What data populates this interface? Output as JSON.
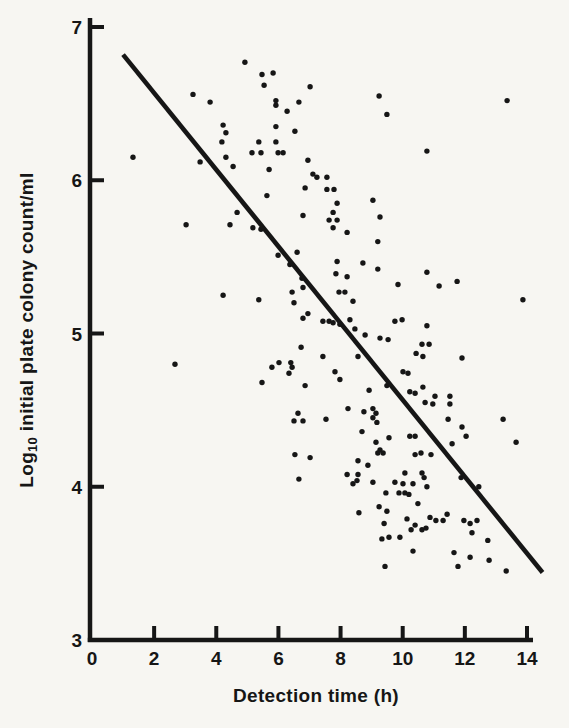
{
  "figure": {
    "background": "#f7f6f2",
    "ink": "#161616"
  },
  "chart_data": {
    "type": "scatter",
    "title": "",
    "xlabel": "Detection time (h)",
    "ylabel": "Log10 initial plate colony count/ml",
    "ylabel_parts": [
      {
        "text": "Log",
        "sub": false
      },
      {
        "text": "10",
        "sub": true
      },
      {
        "text": " initial plate colony count/ml",
        "sub": false
      }
    ],
    "xlim": [
      0,
      14
    ],
    "ylim": [
      3,
      7
    ],
    "xticks": [
      0,
      2,
      4,
      6,
      8,
      10,
      12,
      14
    ],
    "yticks": [
      3,
      4,
      5,
      6,
      7
    ],
    "grid": false,
    "legend": null,
    "marker": {
      "shape": "dot",
      "radius_px": 2.7,
      "color": "#161616"
    },
    "trendline": {
      "x1": 1.0,
      "y1": 6.82,
      "x2": 14.5,
      "y2": 3.44,
      "color": "#161616"
    },
    "points": [
      [
        3.25,
        6.56
      ],
      [
        3.8,
        6.51
      ],
      [
        4.92,
        6.77
      ],
      [
        4.22,
        6.36
      ],
      [
        4.31,
        6.31
      ],
      [
        4.18,
        6.25
      ],
      [
        4.31,
        6.15
      ],
      [
        3.48,
        6.12
      ],
      [
        4.54,
        6.09
      ],
      [
        1.32,
        6.15
      ],
      [
        4.67,
        5.79
      ],
      [
        3.03,
        5.71
      ],
      [
        4.44,
        5.71
      ],
      [
        5.47,
        6.69
      ],
      [
        5.83,
        6.7
      ],
      [
        5.54,
        6.62
      ],
      [
        7.02,
        6.61
      ],
      [
        5.92,
        6.52
      ],
      [
        5.92,
        6.49
      ],
      [
        6.66,
        6.51
      ],
      [
        6.28,
        6.45
      ],
      [
        9.24,
        6.55
      ],
      [
        9.49,
        6.43
      ],
      [
        5.92,
        6.35
      ],
      [
        6.53,
        6.32
      ],
      [
        5.37,
        6.25
      ],
      [
        5.92,
        6.25
      ],
      [
        5.15,
        6.18
      ],
      [
        5.44,
        6.18
      ],
      [
        5.99,
        6.18
      ],
      [
        6.15,
        6.18
      ],
      [
        5.7,
        6.07
      ],
      [
        6.95,
        6.13
      ],
      [
        7.11,
        6.04
      ],
      [
        7.24,
        6.02
      ],
      [
        7.56,
        6.02
      ],
      [
        6.86,
        5.95
      ],
      [
        7.56,
        5.94
      ],
      [
        7.79,
        5.94
      ],
      [
        7.89,
        5.85
      ],
      [
        5.63,
        5.9
      ],
      [
        7.76,
        5.79
      ],
      [
        6.79,
        5.77
      ],
      [
        7.63,
        5.74
      ],
      [
        7.89,
        5.74
      ],
      [
        7.76,
        5.69
      ],
      [
        9.04,
        5.87
      ],
      [
        9.27,
        5.76
      ],
      [
        5.18,
        5.69
      ],
      [
        5.44,
        5.68
      ],
      [
        8.21,
        5.66
      ],
      [
        9.2,
        5.6
      ],
      [
        13.36,
        6.52
      ],
      [
        10.78,
        6.19
      ],
      [
        4.22,
        5.25
      ],
      [
        2.67,
        4.8
      ],
      [
        5.99,
        5.51
      ],
      [
        6.6,
        5.53
      ],
      [
        6.37,
        5.45
      ],
      [
        7.89,
        5.47
      ],
      [
        8.72,
        5.46
      ],
      [
        9.2,
        5.42
      ],
      [
        7.85,
        5.39
      ],
      [
        8.21,
        5.37
      ],
      [
        6.76,
        5.36
      ],
      [
        6.79,
        5.3
      ],
      [
        6.44,
        5.27
      ],
      [
        5.37,
        5.22
      ],
      [
        6.5,
        5.2
      ],
      [
        7.95,
        5.27
      ],
      [
        8.14,
        5.27
      ],
      [
        8.4,
        5.21
      ],
      [
        6.95,
        5.13
      ],
      [
        6.79,
        5.1
      ],
      [
        7.43,
        5.08
      ],
      [
        7.63,
        5.08
      ],
      [
        7.76,
        5.07
      ],
      [
        7.98,
        5.06
      ],
      [
        8.3,
        5.09
      ],
      [
        8.46,
        5.03
      ],
      [
        8.79,
        4.99
      ],
      [
        9.27,
        4.97
      ],
      [
        9.53,
        4.96
      ],
      [
        6.73,
        4.91
      ],
      [
        7.43,
        4.85
      ],
      [
        8.56,
        4.85
      ],
      [
        6.02,
        4.81
      ],
      [
        6.4,
        4.81
      ],
      [
        5.79,
        4.78
      ],
      [
        6.44,
        4.78
      ],
      [
        6.34,
        4.74
      ],
      [
        7.82,
        4.75
      ],
      [
        7.98,
        4.7
      ],
      [
        5.47,
        4.68
      ],
      [
        6.86,
        4.66
      ],
      [
        8.92,
        4.63
      ],
      [
        9.49,
        4.66
      ],
      [
        8.24,
        4.51
      ],
      [
        6.63,
        4.48
      ],
      [
        6.5,
        4.43
      ],
      [
        6.79,
        4.43
      ],
      [
        7.53,
        4.44
      ],
      [
        8.75,
        4.49
      ],
      [
        9.04,
        4.51
      ],
      [
        9.14,
        4.48
      ],
      [
        9.04,
        4.45
      ],
      [
        9.17,
        4.42
      ],
      [
        8.69,
        4.36
      ],
      [
        9.56,
        4.32
      ],
      [
        9.27,
        4.24
      ],
      [
        10.78,
        5.4
      ],
      [
        11.17,
        5.31
      ],
      [
        11.75,
        5.34
      ],
      [
        9.85,
        5.32
      ],
      [
        13.87,
        5.22
      ],
      [
        9.75,
        5.08
      ],
      [
        9.98,
        5.09
      ],
      [
        10.78,
        5.05
      ],
      [
        10.62,
        4.93
      ],
      [
        10.85,
        4.93
      ],
      [
        10.43,
        4.87
      ],
      [
        10.65,
        4.85
      ],
      [
        11.91,
        4.84
      ],
      [
        10.01,
        4.75
      ],
      [
        10.17,
        4.74
      ],
      [
        10.65,
        4.65
      ],
      [
        10.23,
        4.62
      ],
      [
        10.4,
        4.61
      ],
      [
        11.04,
        4.59
      ],
      [
        10.72,
        4.55
      ],
      [
        10.97,
        4.54
      ],
      [
        11.52,
        4.59
      ],
      [
        11.52,
        4.54
      ],
      [
        11.46,
        4.44
      ],
      [
        11.91,
        4.39
      ],
      [
        12.04,
        4.33
      ],
      [
        13.23,
        4.44
      ],
      [
        10.23,
        4.33
      ],
      [
        10.4,
        4.33
      ],
      [
        11.59,
        4.28
      ],
      [
        13.65,
        4.29
      ],
      [
        6.53,
        4.21
      ],
      [
        7.02,
        4.19
      ],
      [
        6.66,
        4.05
      ],
      [
        8.21,
        4.08
      ],
      [
        8.56,
        4.17
      ],
      [
        8.56,
        4.08
      ],
      [
        8.53,
        4.04
      ],
      [
        8.4,
        4.02
      ],
      [
        8.88,
        4.14
      ],
      [
        9.04,
        4.03
      ],
      [
        9.2,
        4.22
      ],
      [
        9.37,
        4.22
      ],
      [
        9.14,
        4.29
      ],
      [
        9.46,
        3.96
      ],
      [
        8.59,
        3.83
      ],
      [
        9.24,
        3.87
      ],
      [
        9.49,
        3.84
      ],
      [
        9.4,
        3.76
      ],
      [
        9.33,
        3.66
      ],
      [
        9.56,
        3.67
      ],
      [
        9.43,
        3.48
      ],
      [
        10.4,
        4.21
      ],
      [
        10.59,
        4.22
      ],
      [
        10.91,
        4.21
      ],
      [
        10.07,
        4.09
      ],
      [
        10.62,
        4.09
      ],
      [
        10.69,
        4.06
      ],
      [
        9.75,
        4.03
      ],
      [
        10.01,
        4.02
      ],
      [
        10.33,
        4.02
      ],
      [
        10.78,
        4.0
      ],
      [
        9.88,
        3.96
      ],
      [
        10.07,
        3.96
      ],
      [
        10.2,
        3.95
      ],
      [
        10.49,
        3.89
      ],
      [
        11.88,
        4.06
      ],
      [
        12.45,
        4.0
      ],
      [
        10.14,
        3.79
      ],
      [
        10.4,
        3.75
      ],
      [
        10.27,
        3.72
      ],
      [
        10.62,
        3.72
      ],
      [
        10.75,
        3.73
      ],
      [
        10.88,
        3.8
      ],
      [
        11.07,
        3.78
      ],
      [
        11.43,
        3.82
      ],
      [
        11.3,
        3.78
      ],
      [
        11.97,
        3.78
      ],
      [
        12.17,
        3.76
      ],
      [
        12.39,
        3.78
      ],
      [
        12.23,
        3.7
      ],
      [
        9.91,
        3.67
      ],
      [
        10.33,
        3.58
      ],
      [
        12.74,
        3.65
      ],
      [
        11.65,
        3.57
      ],
      [
        12.17,
        3.54
      ],
      [
        11.78,
        3.48
      ],
      [
        12.78,
        3.52
      ],
      [
        13.33,
        3.45
      ]
    ]
  }
}
